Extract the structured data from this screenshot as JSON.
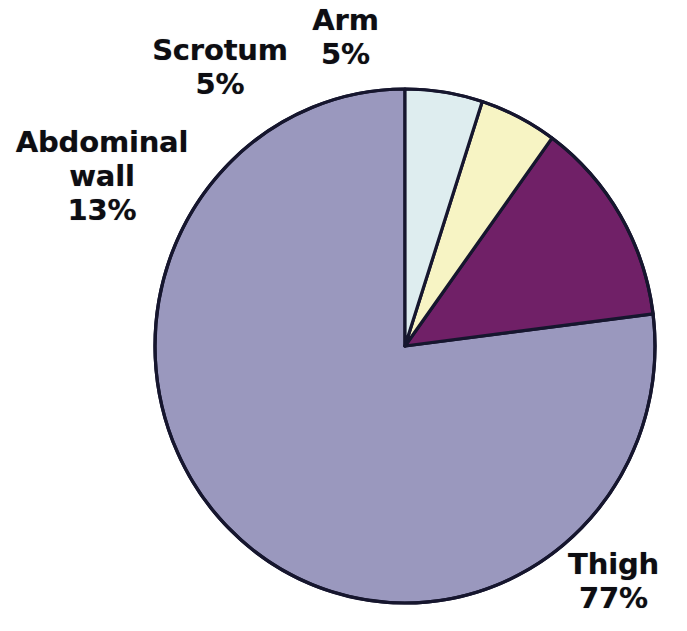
{
  "figure": {
    "background_color": "#ffffff",
    "outline_color": "#16162e",
    "label_text_color": "#0d0d12"
  },
  "chart_data": {
    "type": "pie",
    "title": "",
    "subtitle": "",
    "xlabel": "",
    "ylabel": "",
    "legend_position": "none",
    "grid": false,
    "start_angle_deg": 90,
    "direction": "counterclockwise",
    "units": "percent",
    "total": 100,
    "categories": [
      "Thigh",
      "Abdominal wall",
      "Scrotum",
      "Arm"
    ],
    "values": [
      77,
      13,
      5,
      5
    ],
    "colors": [
      "#9a98be",
      "#702067",
      "#f7f4c4",
      "#deedef"
    ],
    "slices": [
      {
        "name": "Thigh",
        "value": 77,
        "value_text": "77%",
        "color": "#9a98be",
        "color_name": "lavender",
        "label_lines": [
          "Thigh",
          "77%"
        ]
      },
      {
        "name": "Abdominal wall",
        "value": 13,
        "value_text": "13%",
        "color": "#702067",
        "color_name": "dark-magenta",
        "label_lines": [
          "Abdominal",
          "wall",
          "13%"
        ]
      },
      {
        "name": "Scrotum",
        "value": 5,
        "value_text": "5%",
        "color": "#f7f4c4",
        "color_name": "pale-yellow",
        "label_lines": [
          "Scrotum",
          "5%"
        ]
      },
      {
        "name": "Arm",
        "value": 5,
        "value_text": "5%",
        "color": "#deedef",
        "color_name": "pale-cyan",
        "label_lines": [
          "Arm",
          "5%"
        ]
      }
    ]
  },
  "labels": {
    "arm": {
      "name": "Arm",
      "percent": "5%"
    },
    "scrotum": {
      "name": "Scrotum",
      "percent": "5%"
    },
    "abdominal": {
      "name_line1": "Abdominal",
      "name_line2": "wall",
      "percent": "13%"
    },
    "thigh": {
      "name": "Thigh",
      "percent": "77%"
    }
  }
}
